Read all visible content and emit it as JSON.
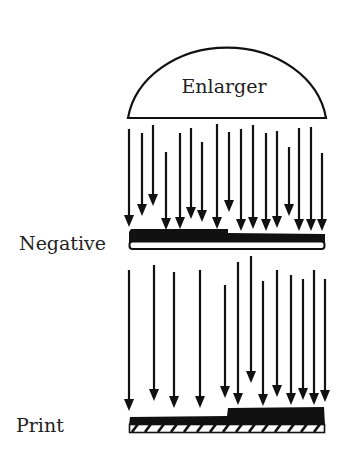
{
  "diagram": {
    "enlarger_label": "Enlarger",
    "negative_label": "Negative",
    "print_label": "Print",
    "colors": {
      "ink": "#111111",
      "background": "#ffffff"
    },
    "upper_arrows": [
      {
        "x": 129,
        "y1": 129,
        "y2": 227
      },
      {
        "x": 142,
        "y1": 133,
        "y2": 216
      },
      {
        "x": 153,
        "y1": 125,
        "y2": 206
      },
      {
        "x": 166,
        "y1": 152,
        "y2": 230
      },
      {
        "x": 180,
        "y1": 133,
        "y2": 229
      },
      {
        "x": 191,
        "y1": 128,
        "y2": 219
      },
      {
        "x": 202,
        "y1": 142,
        "y2": 222
      },
      {
        "x": 217,
        "y1": 124,
        "y2": 229
      },
      {
        "x": 229,
        "y1": 132,
        "y2": 212
      },
      {
        "x": 241,
        "y1": 129,
        "y2": 231
      },
      {
        "x": 253,
        "y1": 125,
        "y2": 229
      },
      {
        "x": 266,
        "y1": 133,
        "y2": 231
      },
      {
        "x": 277,
        "y1": 131,
        "y2": 228
      },
      {
        "x": 289,
        "y1": 147,
        "y2": 216
      },
      {
        "x": 299,
        "y1": 128,
        "y2": 231
      },
      {
        "x": 311,
        "y1": 127,
        "y2": 231
      },
      {
        "x": 322,
        "y1": 153,
        "y2": 231
      }
    ],
    "lower_arrows": [
      {
        "x": 129,
        "y1": 270,
        "y2": 411
      },
      {
        "x": 154,
        "y1": 265,
        "y2": 401
      },
      {
        "x": 174,
        "y1": 272,
        "y2": 408
      },
      {
        "x": 200,
        "y1": 270,
        "y2": 408
      },
      {
        "x": 225,
        "y1": 285,
        "y2": 398
      },
      {
        "x": 238,
        "y1": 262,
        "y2": 405
      },
      {
        "x": 251,
        "y1": 256,
        "y2": 383
      },
      {
        "x": 263,
        "y1": 281,
        "y2": 406
      },
      {
        "x": 277,
        "y1": 270,
        "y2": 397
      },
      {
        "x": 291,
        "y1": 275,
        "y2": 405
      },
      {
        "x": 303,
        "y1": 279,
        "y2": 400
      },
      {
        "x": 314,
        "y1": 270,
        "y2": 405
      },
      {
        "x": 325,
        "y1": 279,
        "y2": 402
      }
    ]
  }
}
